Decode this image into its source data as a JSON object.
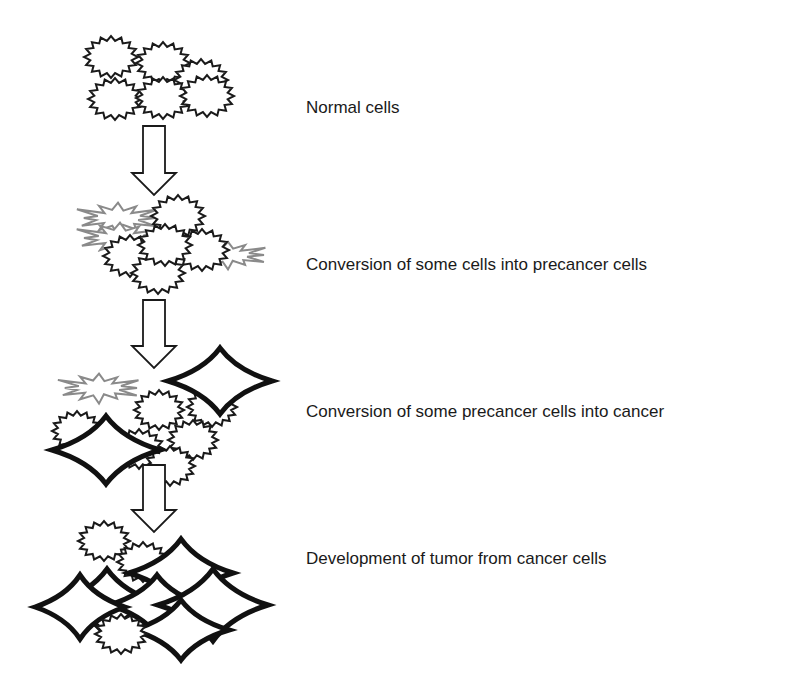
{
  "diagram": {
    "type": "process-flow",
    "direction": "top-to-bottom",
    "stages": [
      {
        "id": "normal",
        "label": "Normal cells",
        "label_y": 106,
        "cells": {
          "normal": 6,
          "precancer": 0,
          "cancer": 0
        }
      },
      {
        "id": "precancer",
        "label": "Conversion of some cells into precancer cells",
        "label_y": 263,
        "cells": {
          "normal": 5,
          "precancer": 3,
          "cancer": 0
        }
      },
      {
        "id": "cancer",
        "label": "Conversion of some precancer cells into cancer",
        "label_y": 410,
        "cells": {
          "normal": 5,
          "precancer": 1,
          "cancer": 2
        }
      },
      {
        "id": "tumor",
        "label": "Development of tumor from cancer cells",
        "label_y": 557,
        "cells": {
          "normal": 3,
          "precancer": 0,
          "cancer": 6
        }
      }
    ],
    "arrows": [
      {
        "from": "normal",
        "to": "precancer"
      },
      {
        "from": "precancer",
        "to": "cancer"
      },
      {
        "from": "cancer",
        "to": "tumor"
      }
    ],
    "legend_shapes": {
      "normal": "black jagged starburst outline",
      "precancer": "gray irregular spiky outline",
      "cancer": "thick black four-pointed star"
    },
    "colors": {
      "normal_stroke": "#1a1a1a",
      "precancer_stroke": "#8a8a8a",
      "cancer_stroke": "#111111",
      "arrow_stroke": "#1a1a1a",
      "background": "#ffffff"
    }
  }
}
